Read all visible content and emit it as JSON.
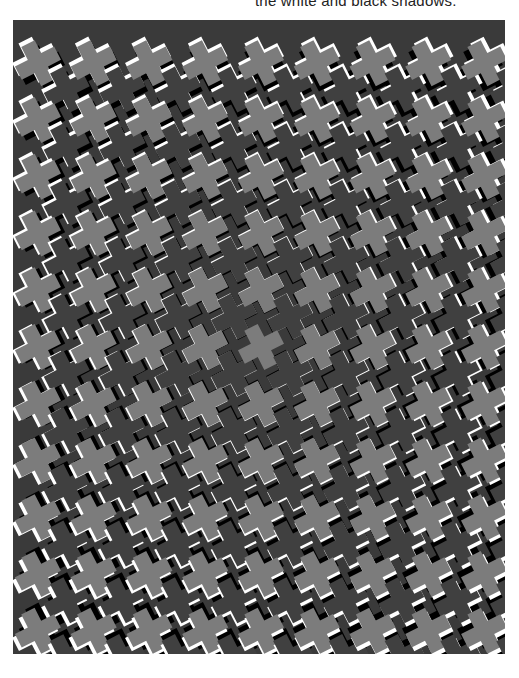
{
  "caption": {
    "text": "the white and black shadows."
  },
  "figure": {
    "name": "interlocking-cross-pattern",
    "width": 492,
    "height": 634,
    "colors": {
      "background": "#3a3a3a",
      "light_cross": "#7c7c7c",
      "dark_cross": "#404040",
      "highlight": "#ffffff",
      "shadow": "#000000"
    },
    "lattice": {
      "cols": 9,
      "rows": 12,
      "spacing_x": 56,
      "spacing_y": 57,
      "origin_x": 24,
      "origin_y": 42,
      "rotation_deg": -27,
      "arm_length": 22,
      "arm_half_width": 7.5,
      "max_offset": 5,
      "center_x": 246,
      "center_y": 317
    }
  }
}
